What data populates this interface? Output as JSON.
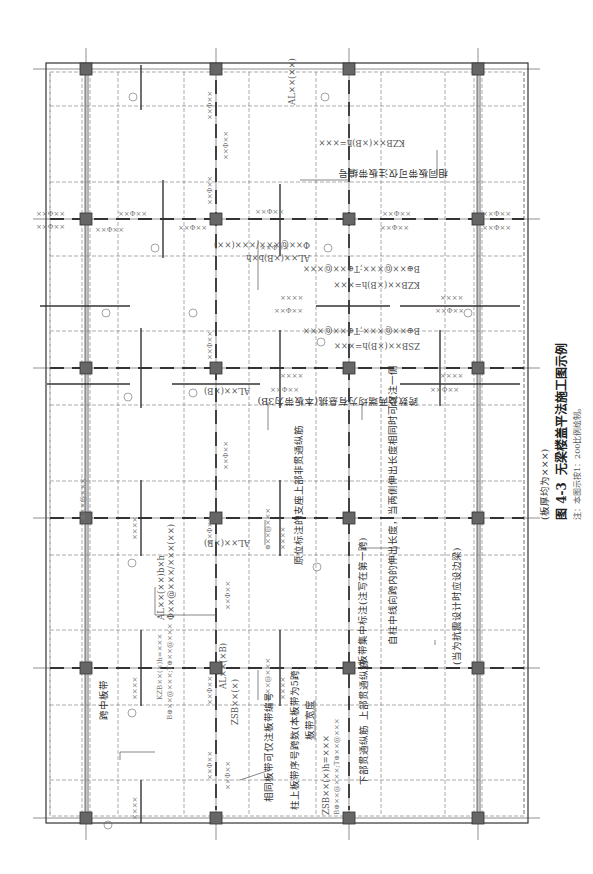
{
  "figure": {
    "number": "图 4-3",
    "title": "无梁楼盖平法施工图示例",
    "thickness_note": "(板厚均为×××)",
    "note": "注：本图示按1：200比例绘制。",
    "orientation": "rotated 90° clockwise"
  },
  "colors": {
    "background": "#ffffff",
    "line": "#333333",
    "dashed": "#888888",
    "column_fill": "#666666",
    "text": "#444444"
  },
  "grid": {
    "column_x": [
      86,
      216,
      349,
      478
    ],
    "column_y": [
      69,
      219,
      368,
      518,
      668,
      818
    ]
  },
  "callouts": {
    "midspan_strip": "跨中板带",
    "same_strip_number": "相同板带可仅注板带编号",
    "column_strip_span": "柱上板带序号跨数(本板带为5跨)",
    "strip_width": "板带宽度",
    "strip_concentrated": "板带集中标注(注写在第一跨)",
    "bottom_through_bars": "下部贯通纵筋",
    "top_through_bars": "上部贯通纵筋",
    "extension_length": "自柱中线向跨内的伸出长度，当两侧伸出长度相同时可仅注一侧",
    "seismic_edge_beam": "(当为抗震设计时应设边梁)",
    "support_original": "原位标注的支座上部非贯通纵筋",
    "span_cantilever": "跨数及两端均为有悬挑(本板带为3B)",
    "same_strip_top": "相同板带可仅注板带编号"
  },
  "labels": {
    "kzb_top1": "KZB××(×B)h=×××",
    "kzb_top2": "B⊕××@×××;T⊕××@×××",
    "kzb_mid1": "KZB××(×B)h=×××",
    "kzb_mid2": "B⊕××@×××;T⊕××@×××",
    "zsb_mid1": "ZSB××(×B)h=×××",
    "zsb_mid2": "B⊕××@×××;T⊕××@×××",
    "kzb_left1": "KZB××(×)h=×××",
    "kzb_left2": "B⊕××@×××;T⊕××@×××",
    "zsb_bottom1": "ZSB××(×)h=×××",
    "zsb_bottom2": "B⊕××@×××;T⊕××@×××",
    "zsb_short": "ZSB××(×)",
    "al_top": "AL××(××)",
    "al_detail": "AL××(×B)b×h",
    "al_detail2": "Φ××@×××/×××(××)",
    "al_mid": "AL××(×B)",
    "al_mid2": "AL××(×B)",
    "al_left": "AL××(××)b×h",
    "al_left2": "Φ××@×××/×××(××)",
    "al_small": "AL××(×B)",
    "rebar": "××Φ××",
    "rebar_at": "⊕××@×××",
    "rebar_xx": "××××"
  },
  "circle_numbers": [
    "①",
    "②",
    "③",
    "④",
    "⑤",
    "⑥",
    "⑦",
    "⑧",
    "⑨",
    "⑩",
    "⑪",
    "⑫"
  ]
}
